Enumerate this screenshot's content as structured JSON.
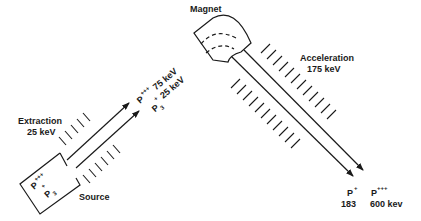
{
  "diagram": {
    "type": "particle-accelerator-schematic",
    "colors": {
      "line": "#1a1a1a",
      "background": "#ffffff"
    },
    "labels": {
      "magnet": "Magnet",
      "acceleration_title": "Acceleration",
      "acceleration_energy": "175 keV",
      "extraction_title": "Extraction",
      "extraction_energy": "25 keV",
      "source": "Source",
      "source_ion1_base": "P",
      "source_ion1_charge": "+++",
      "source_ion2_charge": "+",
      "source_ion2_base": "P",
      "source_ion2_sub": "3",
      "mid_ion1_base": "P",
      "mid_ion1_charge": "+++",
      "mid_ion1_energy": "75 keV",
      "mid_ion2_charge": "+",
      "mid_ion2_energy": "25 keV",
      "mid_ion2_base": "P",
      "mid_ion2_sub": "3",
      "out_ion1_base": "P",
      "out_ion1_charge": "+",
      "out_ion1_value": "183",
      "out_ion2_base": "P",
      "out_ion2_charge": "+++",
      "out_ion2_value": "600 kev"
    }
  }
}
